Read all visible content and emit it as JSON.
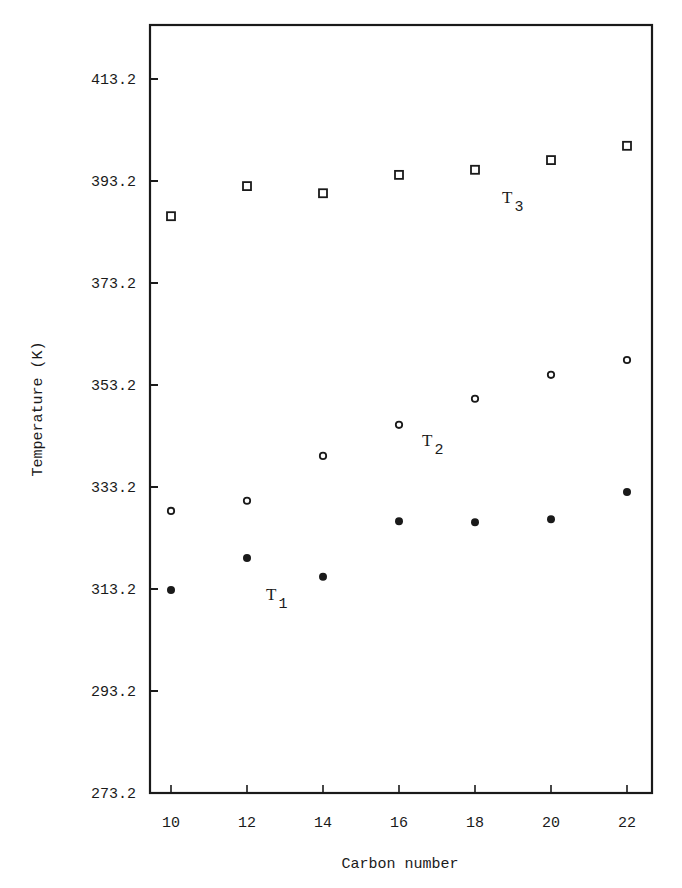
{
  "chart_data": {
    "type": "scatter",
    "title": "",
    "xlabel": "Carbon number",
    "ylabel": "Temperature (K)",
    "x": [
      10,
      12,
      14,
      16,
      18,
      20,
      22
    ],
    "xlim": [
      9.4,
      23.2
    ],
    "ylim": [
      273.2,
      425.0
    ],
    "xticks": [
      10,
      12,
      14,
      16,
      18,
      20,
      22
    ],
    "yticks": [
      273.2,
      293.2,
      313.2,
      333.2,
      353.2,
      373.2,
      393.2,
      413.2
    ],
    "xtick_labels": [
      "10",
      "12",
      "14",
      "16",
      "18",
      "20",
      "22"
    ],
    "ytick_labels": [
      "273.2",
      "293.2",
      "313.2",
      "333.2",
      "353.2",
      "373.2",
      "393.2",
      "413.2"
    ],
    "grid": false,
    "legend": "none (series labelled inline)",
    "series": [
      {
        "name": "T1",
        "label_main": "T",
        "label_sub": "1",
        "marker": "filled-circle",
        "values": [
          313.0,
          319.3,
          315.6,
          326.5,
          326.3,
          326.9,
          332.2
        ],
        "label_pos": {
          "x": 266,
          "y": 600
        }
      },
      {
        "name": "T2",
        "label_main": "T",
        "label_sub": "2",
        "marker": "open-circle",
        "values": [
          328.5,
          330.5,
          339.3,
          345.4,
          350.5,
          355.2,
          358.1
        ],
        "label_pos": {
          "x": 422,
          "y": 446
        }
      },
      {
        "name": "T3",
        "label_main": "T",
        "label_sub": "3",
        "marker": "open-square",
        "values": [
          386.3,
          392.2,
          390.8,
          394.4,
          395.4,
          397.3,
          400.1
        ],
        "label_pos": {
          "x": 502,
          "y": 203
        }
      }
    ]
  },
  "colors": {
    "ink": "#1a1a1a",
    "background": "#ffffff"
  }
}
